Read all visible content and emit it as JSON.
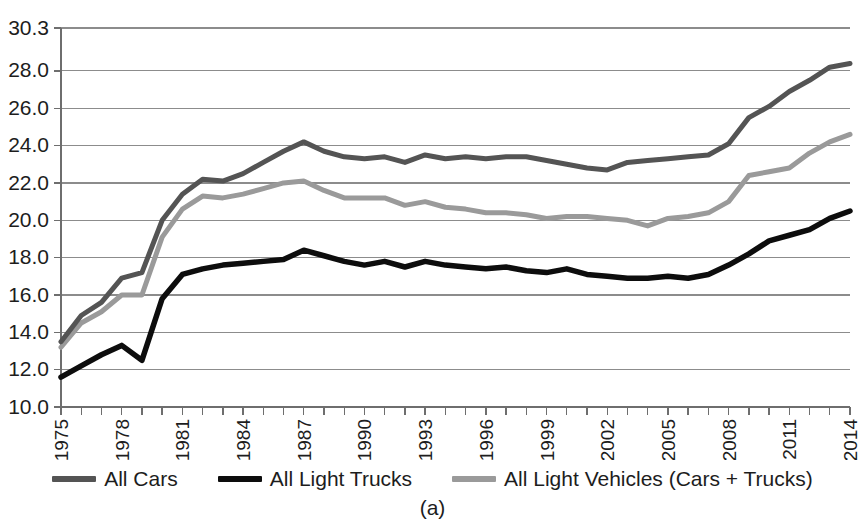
{
  "figure": {
    "caption": "(a)",
    "background": "#ffffff"
  },
  "legend": {
    "position": "bottom",
    "items": [
      {
        "label": "All Cars",
        "color": "#545454",
        "name": "legend-all-cars"
      },
      {
        "label": "All Light Trucks",
        "color": "#0d0d0d",
        "name": "legend-all-light-trucks"
      },
      {
        "label": "All Light Vehicles (Cars + Trucks)",
        "color": "#9a9a9a",
        "name": "legend-all-light-vehicles"
      }
    ]
  },
  "axes": {
    "y_tick_labels": [
      "30.3",
      "28.0",
      "26.0",
      "24.0",
      "22.0",
      "20.0",
      "18.0",
      "16.0",
      "14.0",
      "12.0",
      "10.0"
    ],
    "x_tick_labels": [
      "1975",
      "1978",
      "1981",
      "1984",
      "1987",
      "1990",
      "1993",
      "1996",
      "1999",
      "2002",
      "2005",
      "2008",
      "2011",
      "2014"
    ],
    "y_min": 10.0,
    "y_max": 30.3,
    "x_min": 1975,
    "x_max": 2014
  },
  "chart_data": {
    "type": "line",
    "title": "",
    "subtitle": "",
    "xlabel": "",
    "ylabel": "",
    "xlim": [
      1975,
      2014
    ],
    "ylim": [
      10.0,
      30.3
    ],
    "grid": true,
    "legend_position": "bottom",
    "annotations": [
      "(a)"
    ],
    "x": [
      1975,
      1976,
      1977,
      1978,
      1979,
      1980,
      1981,
      1982,
      1983,
      1984,
      1985,
      1986,
      1987,
      1988,
      1989,
      1990,
      1991,
      1992,
      1993,
      1994,
      1995,
      1996,
      1997,
      1998,
      1999,
      2000,
      2001,
      2002,
      2003,
      2004,
      2005,
      2006,
      2007,
      2008,
      2009,
      2010,
      2011,
      2012,
      2013,
      2014
    ],
    "categories": [
      "1975",
      "1976",
      "1977",
      "1978",
      "1979",
      "1980",
      "1981",
      "1982",
      "1983",
      "1984",
      "1985",
      "1986",
      "1987",
      "1988",
      "1989",
      "1990",
      "1991",
      "1992",
      "1993",
      "1994",
      "1995",
      "1996",
      "1997",
      "1998",
      "1999",
      "2000",
      "2001",
      "2002",
      "2003",
      "2004",
      "2005",
      "2006",
      "2007",
      "2008",
      "2009",
      "2010",
      "2011",
      "2012",
      "2013",
      "2014"
    ],
    "series": [
      {
        "name": "All Cars",
        "color": "#545454",
        "values": [
          13.5,
          14.9,
          15.6,
          16.9,
          17.2,
          20.0,
          21.4,
          22.2,
          22.1,
          22.5,
          23.1,
          23.7,
          24.2,
          23.7,
          23.4,
          23.3,
          23.4,
          23.1,
          23.5,
          23.3,
          23.4,
          23.3,
          23.4,
          23.4,
          23.2,
          23.0,
          22.8,
          22.7,
          23.1,
          23.2,
          23.3,
          23.4,
          23.5,
          24.1,
          25.5,
          26.1,
          26.9,
          27.5,
          28.2,
          28.4
        ]
      },
      {
        "name": "All Light Trucks",
        "color": "#0d0d0d",
        "values": [
          11.6,
          12.2,
          12.8,
          13.3,
          12.5,
          15.8,
          17.1,
          17.4,
          17.6,
          17.7,
          17.8,
          17.9,
          18.4,
          18.1,
          17.8,
          17.6,
          17.8,
          17.5,
          17.8,
          17.6,
          17.5,
          17.4,
          17.5,
          17.3,
          17.2,
          17.4,
          17.1,
          17.0,
          16.9,
          16.9,
          17.0,
          16.9,
          17.1,
          17.6,
          18.2,
          18.9,
          19.2,
          19.5,
          20.1,
          20.5
        ]
      },
      {
        "name": "All Light Vehicles (Cars + Trucks)",
        "color": "#9a9a9a",
        "values": [
          13.2,
          14.5,
          15.1,
          16.0,
          16.0,
          19.1,
          20.6,
          21.3,
          21.2,
          21.4,
          21.7,
          22.0,
          22.1,
          21.6,
          21.2,
          21.2,
          21.2,
          20.8,
          21.0,
          20.7,
          20.6,
          20.4,
          20.4,
          20.3,
          20.1,
          20.2,
          20.2,
          20.1,
          20.0,
          19.7,
          20.1,
          20.2,
          20.4,
          21.0,
          22.4,
          22.6,
          22.8,
          23.6,
          24.2,
          24.6
        ]
      }
    ]
  }
}
